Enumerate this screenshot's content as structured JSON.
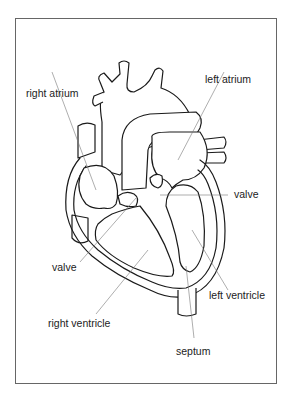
{
  "diagram": {
    "labels": {
      "right_atrium": "right atrium",
      "left_atrium": "left atrium",
      "valve_right": "valve",
      "valve_left": "valve",
      "left_ventricle": "left ventricle",
      "right_ventricle": "right ventricle",
      "septum": "septum"
    },
    "colors": {
      "line": "#1a1a1a",
      "leader": "#777777",
      "frame": "#666666",
      "background": "#ffffff"
    }
  }
}
